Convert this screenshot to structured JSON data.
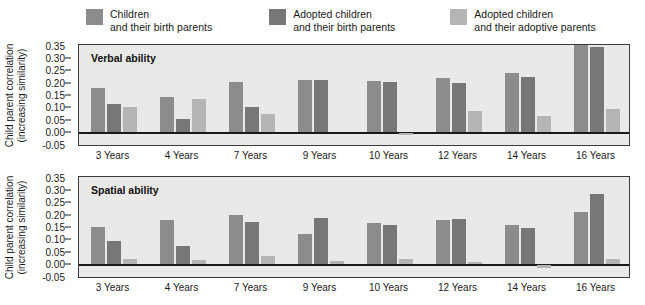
{
  "legend": {
    "items": [
      {
        "label": "Children\nand their birth parents",
        "color": "#8c8c8c",
        "swatch_name": "legend-swatch-children-birth"
      },
      {
        "label": "Adopted children\nand their birth parents",
        "color": "#777777",
        "swatch_name": "legend-swatch-adopted-birth"
      },
      {
        "label": "Adopted children\nand their adoptive parents",
        "color": "#b5b5b5",
        "swatch_name": "legend-swatch-adopted-adoptive"
      }
    ]
  },
  "axis": {
    "ylabel_line1": "Child parent correlation",
    "ylabel_line2": "(increasing similarity)",
    "yticks": [
      "0.35",
      "0.30",
      "0.25",
      "0.20",
      "0.15",
      "0.10",
      "0.05",
      "0.00",
      "-0.05"
    ],
    "ytick_values": [
      0.35,
      0.3,
      0.25,
      0.2,
      0.15,
      0.1,
      0.05,
      0.0,
      -0.05
    ]
  },
  "chart_data": [
    {
      "type": "bar",
      "title": "Verbal ability",
      "xlabel": "",
      "ylabel": "Child parent correlation (increasing similarity)",
      "ylim": [
        -0.05,
        0.35
      ],
      "grid": false,
      "legend_position": "top",
      "categories": [
        "3 Years",
        "4 Years",
        "7 Years",
        "9 Years",
        "10 Years",
        "12 Years",
        "14 Years",
        "16 Years"
      ],
      "series": [
        {
          "name": "Children and their birth parents",
          "color": "#8c8c8c",
          "values": [
            0.175,
            0.14,
            0.2,
            0.21,
            0.205,
            0.215,
            0.235,
            0.35
          ]
        },
        {
          "name": "Adopted children and their birth parents",
          "color": "#777777",
          "values": [
            0.11,
            0.05,
            0.1,
            0.21,
            0.2,
            0.195,
            0.22,
            0.34
          ]
        },
        {
          "name": "Adopted children and their adoptive parents",
          "color": "#b5b5b5",
          "values": [
            0.1,
            0.13,
            0.07,
            0.0,
            -0.01,
            0.085,
            0.065,
            0.09
          ]
        }
      ]
    },
    {
      "type": "bar",
      "title": "Spatial ability",
      "xlabel": "",
      "ylabel": "Child parent correlation (increasing similarity)",
      "ylim": [
        -0.05,
        0.35
      ],
      "grid": false,
      "legend_position": "top",
      "categories": [
        "3 Years",
        "4 Years",
        "7 Years",
        "9 Years",
        "10 Years",
        "12 Years",
        "14 Years",
        "16 Years"
      ],
      "series": [
        {
          "name": "Children and their birth parents",
          "color": "#8c8c8c",
          "values": [
            0.15,
            0.175,
            0.195,
            0.12,
            0.165,
            0.175,
            0.155,
            0.21
          ]
        },
        {
          "name": "Adopted children and their birth parents",
          "color": "#777777",
          "values": [
            0.09,
            0.07,
            0.17,
            0.185,
            0.155,
            0.18,
            0.145,
            0.28
          ]
        },
        {
          "name": "Adopted children and their adoptive parents",
          "color": "#b5b5b5",
          "values": [
            0.02,
            0.015,
            0.03,
            0.01,
            0.02,
            0.005,
            -0.012,
            0.02
          ]
        }
      ]
    }
  ]
}
